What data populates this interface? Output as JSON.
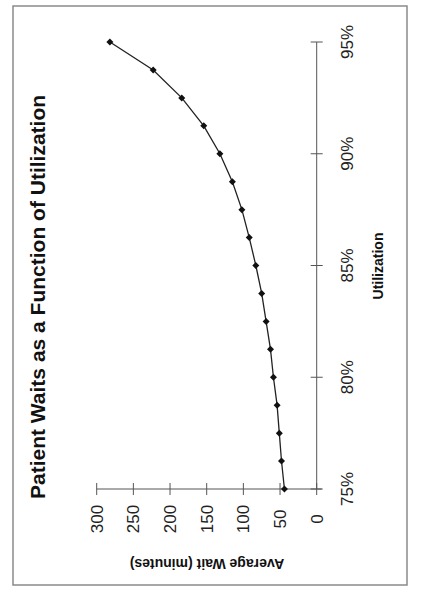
{
  "chart_data": {
    "type": "line",
    "title": "Patient Waits as a Function of Utilization",
    "xlabel": "Utilization",
    "ylabel": "Average Wait (minutes)",
    "x": [
      75,
      76.25,
      77.5,
      78.75,
      80,
      81.25,
      82.5,
      83.75,
      85,
      86.25,
      87.5,
      88.75,
      90,
      91.25,
      92.5,
      93.75,
      95
    ],
    "series": [
      {
        "name": "Average Wait",
        "values": [
          44,
          48,
          51,
          54,
          59,
          63,
          69,
          75,
          83,
          92,
          102,
          115,
          132,
          154,
          184,
          223,
          282
        ],
        "marker": "diamond",
        "color": "#111111"
      }
    ],
    "xlim": [
      75,
      95
    ],
    "ylim": [
      0,
      300
    ],
    "xticks": [
      "75%",
      "80%",
      "85%",
      "90%",
      "95%"
    ],
    "xtick_values": [
      75,
      80,
      85,
      90,
      95
    ],
    "yticks": [
      "0",
      "50",
      "100",
      "150",
      "200",
      "250",
      "300"
    ],
    "ytick_values": [
      0,
      50,
      100,
      150,
      200,
      250,
      300
    ],
    "grid": false,
    "legend": null,
    "orientation": "page rotated 90° counter-clockwise"
  }
}
